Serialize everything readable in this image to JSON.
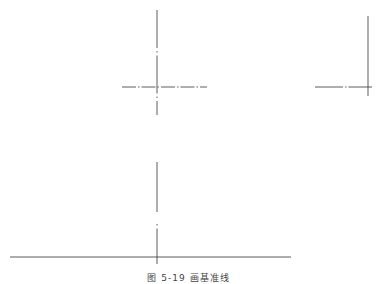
{
  "figure": {
    "caption": "图 5-19  画基准线",
    "line_color": "#333333",
    "views": [
      {
        "name": "front-view-baselines",
        "vertical_centerline": {
          "x": 157,
          "y1": 10,
          "y2": 115,
          "style": "dash-dot"
        },
        "horizontal_centerline": {
          "y": 87,
          "x1": 122,
          "x2": 207,
          "style": "dash-dot"
        }
      },
      {
        "name": "side-view-baselines",
        "vertical_line": {
          "x": 368,
          "y1": 16,
          "y2": 96,
          "style": "solid"
        },
        "horizontal_centerline": {
          "y": 87,
          "x1": 315,
          "x2": 372,
          "style": "dash-dot"
        }
      },
      {
        "name": "top-view-baselines",
        "vertical_centerline": {
          "x": 157,
          "y1": 162,
          "y2": 264,
          "style": "dash-dot"
        },
        "horizontal_line": {
          "y": 257,
          "x1": 10,
          "x2": 291,
          "style": "solid"
        }
      }
    ]
  }
}
